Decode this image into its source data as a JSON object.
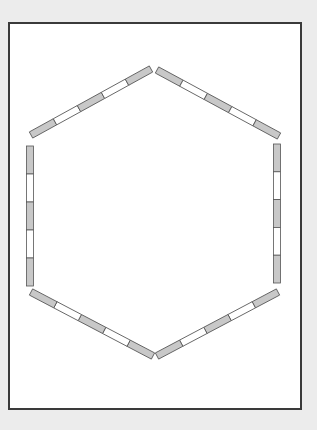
{
  "canvas": {
    "width": 317,
    "height": 430,
    "background": "#ececec"
  },
  "frame": {
    "x": 8,
    "y": 22,
    "width": 292,
    "height": 386,
    "fill": "#ffffff",
    "stroke": "#3a3a3a"
  },
  "hexagon": {
    "vertices": [
      [
        154,
        68
      ],
      [
        281,
        140
      ],
      [
        281,
        286
      ],
      [
        155,
        358
      ],
      [
        30,
        286
      ],
      [
        30,
        140
      ]
    ],
    "bar_thickness": 7,
    "colors": {
      "filled": "#c8c8c8",
      "empty": "#ffffff",
      "stroke": "#555555"
    },
    "edges": [
      {
        "name": "upper-left-edge",
        "from": [
          31,
          135
        ],
        "to": [
          151,
          69
        ],
        "pattern": [
          "filled",
          "empty",
          "filled",
          "empty",
          "filled"
        ]
      },
      {
        "name": "upper-right-edge",
        "from": [
          157,
          70
        ],
        "to": [
          279,
          136
        ],
        "pattern": [
          "filled",
          "empty",
          "filled",
          "empty",
          "filled"
        ]
      },
      {
        "name": "right-edge",
        "from": [
          277,
          144
        ],
        "to": [
          277,
          283
        ],
        "pattern": [
          "filled",
          "empty",
          "filled",
          "empty",
          "filled"
        ]
      },
      {
        "name": "lower-right-edge",
        "from": [
          278,
          292
        ],
        "to": [
          157,
          356
        ],
        "pattern": [
          "filled",
          "empty",
          "filled",
          "empty",
          "filled"
        ]
      },
      {
        "name": "lower-left-edge",
        "from": [
          153,
          356
        ],
        "to": [
          31,
          292
        ],
        "pattern": [
          "filled",
          "empty",
          "filled",
          "empty",
          "filled"
        ]
      },
      {
        "name": "left-edge",
        "from": [
          30,
          146
        ],
        "to": [
          30,
          286
        ],
        "pattern": [
          "filled",
          "empty",
          "filled",
          "empty",
          "filled"
        ]
      }
    ]
  }
}
